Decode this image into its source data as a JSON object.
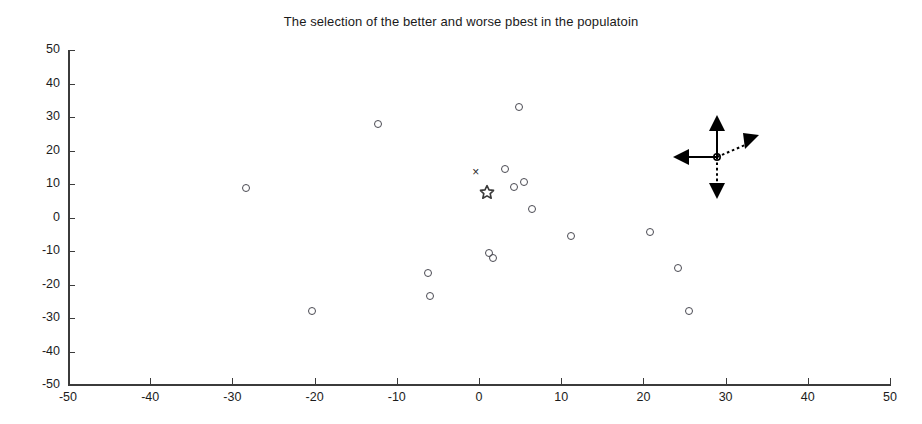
{
  "chart_data": {
    "type": "scatter",
    "title": "The selection of the better and worse pbest in the populatoin",
    "xlabel": "",
    "ylabel": "",
    "xlim": [
      -50,
      50
    ],
    "ylim": [
      -50,
      50
    ],
    "grid": false,
    "legend": "none",
    "xticks": [
      "-50",
      "-40",
      "-30",
      "-20",
      "-10",
      "0",
      "10",
      "20",
      "30",
      "40",
      "50"
    ],
    "yticks": [
      "50",
      "40",
      "30",
      "20",
      "10",
      "0",
      "-10",
      "-20",
      "-30",
      "-40",
      "-50"
    ],
    "xtick_values": [
      -50,
      -40,
      -30,
      -20,
      -10,
      0,
      10,
      20,
      30,
      40,
      50
    ],
    "ytick_values": [
      50,
      40,
      30,
      20,
      10,
      0,
      -10,
      -20,
      -30,
      -40,
      -50
    ],
    "series": [
      {
        "name": "population particles",
        "marker": "circle",
        "color": "#4a4a52",
        "points": [
          [
            -28.3,
            8.7
          ],
          [
            -20.3,
            -28.0
          ],
          [
            -12.3,
            28.0
          ],
          [
            -6.2,
            -16.5
          ],
          [
            -6.0,
            -23.5
          ],
          [
            1.2,
            -10.5
          ],
          [
            1.7,
            -12.0
          ],
          [
            3.2,
            14.5
          ],
          [
            4.9,
            32.9
          ],
          [
            4.2,
            9.0
          ],
          [
            5.5,
            10.5
          ],
          [
            6.4,
            2.5
          ],
          [
            11.2,
            -5.5
          ],
          [
            20.8,
            -4.2
          ],
          [
            24.2,
            -15.0
          ],
          [
            25.6,
            -28.0
          ]
        ]
      },
      {
        "name": "worse pbest",
        "marker": "x",
        "color": "#2a2a2a",
        "points": [
          [
            -0.4,
            13.5
          ]
        ]
      },
      {
        "name": "better pbest",
        "marker": "star",
        "color": "#3a3a3a",
        "points": [
          [
            1.0,
            7.5
          ]
        ]
      }
    ],
    "annotations": [
      {
        "name": "four-way-arrow",
        "type": "cross-arrows",
        "x": 29.0,
        "y": 18.0,
        "arrows": [
          "up",
          "down",
          "left",
          "right"
        ],
        "solid": [
          "up",
          "left"
        ],
        "dotted": [
          "down",
          "right"
        ],
        "color": "#000000"
      }
    ]
  }
}
